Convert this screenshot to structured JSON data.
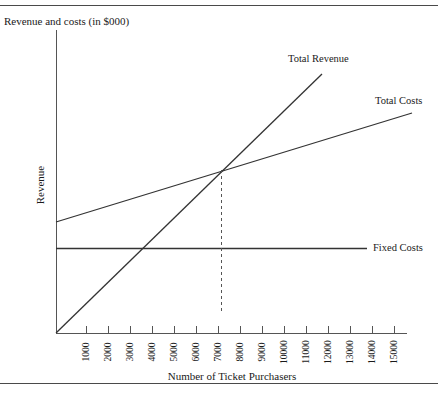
{
  "chart_data": {
    "type": "line",
    "title": "Revenue and costs (in $000)",
    "xlabel": "Number of Ticket Purchasers",
    "ylabel": "Revenue",
    "xlim": [
      0,
      16000
    ],
    "ylim": [
      0,
      100
    ],
    "grid": false,
    "legend_position": "inline-right-of-series",
    "xticks": [
      "1000",
      "2000",
      "3000",
      "4000",
      "5000",
      "6000",
      "7000",
      "8000",
      "9000",
      "10000",
      "11000",
      "12000",
      "13000",
      "14000",
      "15000"
    ],
    "xtick_values": [
      1000,
      2000,
      3000,
      4000,
      5000,
      6000,
      7000,
      8000,
      9000,
      10000,
      11000,
      12000,
      13000,
      14000,
      15000
    ],
    "yticks": [],
    "series": [
      {
        "name": "Total Revenue",
        "x": [
          0,
          12000
        ],
        "values": [
          0,
          96
        ],
        "style": "solid"
      },
      {
        "name": "Total Costs",
        "x": [
          0,
          16000
        ],
        "values": [
          41,
          84
        ],
        "style": "solid"
      },
      {
        "name": "Fixed Costs",
        "x": [
          0,
          14000
        ],
        "values": [
          29,
          29
        ],
        "style": "solid"
      }
    ],
    "annotations": [
      {
        "name": "breakeven-line",
        "type": "vertical-dashed",
        "x": 8200,
        "y_from": 0,
        "y_to": 66
      }
    ]
  },
  "labels": {
    "title": "Revenue and costs (in $000)",
    "y_axis": "Revenue",
    "x_axis": "Number of Ticket Purchasers",
    "total_revenue": "Total Revenue",
    "total_costs": "Total Costs",
    "fixed_costs": "Fixed Costs"
  },
  "colors": {
    "line": "#333333",
    "axis": "#555555",
    "rule": "#4a4a4a",
    "text": "#1a1a1a",
    "background": "#ffffff"
  }
}
